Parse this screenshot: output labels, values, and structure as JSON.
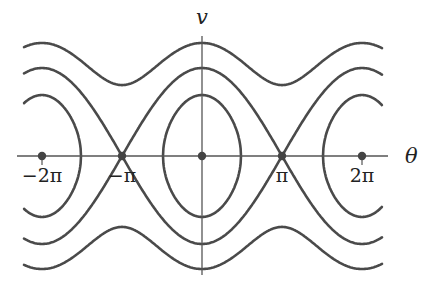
{
  "diagram": {
    "type": "phase-portrait",
    "colors": {
      "curve": "#4a4a4a",
      "axis": "#555555",
      "point": "#444444",
      "background": "#ffffff"
    },
    "axes": {
      "x_label": "θ",
      "y_label": "v"
    },
    "tick_labels": [
      {
        "value": -2,
        "label": "−2π"
      },
      {
        "value": -1,
        "label": "−π"
      },
      {
        "value": 1,
        "label": "π"
      },
      {
        "value": 2,
        "label": "2π"
      }
    ],
    "fixed_points": [
      -2,
      -1,
      0,
      1,
      2
    ],
    "energy_levels": [
      {
        "name": "outer-rotation",
        "k": 2.3
      },
      {
        "name": "separatrix",
        "k": 1.0
      },
      {
        "name": "libration",
        "k": -0.04
      }
    ]
  }
}
